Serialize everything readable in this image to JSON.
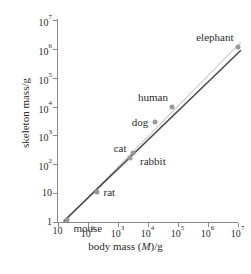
{
  "chart_data": {
    "type": "scatter",
    "title": "",
    "xlabel": "body mass (M)/g",
    "ylabel": "skeleton mass/g",
    "xscale": "log",
    "yscale": "log",
    "xlim": [
      10,
      10000000
    ],
    "ylim": [
      1,
      10000000
    ],
    "grid": false,
    "legend": null,
    "xticks": [
      {
        "value": 10,
        "label": "10",
        "exp": ""
      },
      {
        "value": 100,
        "label": "10",
        "exp": "2"
      },
      {
        "value": 1000,
        "label": "10",
        "exp": "3"
      },
      {
        "value": 10000,
        "label": "10",
        "exp": "4"
      },
      {
        "value": 100000,
        "label": "10",
        "exp": "5"
      },
      {
        "value": 1000000,
        "label": "10",
        "exp": "6"
      },
      {
        "value": 10000000,
        "label": "10",
        "exp": "7"
      }
    ],
    "yticks": [
      {
        "value": 1,
        "label": "1",
        "exp": ""
      },
      {
        "value": 10,
        "label": "10",
        "exp": ""
      },
      {
        "value": 100,
        "label": "10",
        "exp": "2"
      },
      {
        "value": 1000,
        "label": "10",
        "exp": "3"
      },
      {
        "value": 10000,
        "label": "10",
        "exp": "4"
      },
      {
        "value": 100000,
        "label": "10",
        "exp": "5"
      },
      {
        "value": 1000000,
        "label": "10",
        "exp": "6"
      },
      {
        "value": 10000000,
        "label": "10",
        "exp": "7"
      }
    ],
    "points": [
      {
        "name": "mouse",
        "x": 20,
        "y": 1.2,
        "label": "mouse",
        "label_pos": "right-below"
      },
      {
        "name": "rat",
        "x": 200,
        "y": 11,
        "label": "rat",
        "label_pos": "right"
      },
      {
        "name": "cat",
        "x": 2700,
        "y": 160,
        "label": "cat",
        "label_pos": "left-above"
      },
      {
        "name": "rabbit",
        "x": 3300,
        "y": 250,
        "label": "rabbit",
        "label_pos": "right-below"
      },
      {
        "name": "dog",
        "x": 18000,
        "y": 3000,
        "label": "dog",
        "label_pos": "left"
      },
      {
        "name": "human",
        "x": 65000,
        "y": 10000,
        "label": "human",
        "label_pos": "left-above"
      },
      {
        "name": "elephant",
        "x": 10000000,
        "y": 1200000,
        "label": "elephant",
        "label_pos": "left-above"
      }
    ],
    "series": [
      {
        "name": "fit-line",
        "type": "line",
        "color": "#b4b4b4",
        "description": "light grey best-fit line through data points",
        "x": [
          16,
          13000000
        ],
        "y": [
          1.0,
          1700000
        ]
      },
      {
        "name": "reference-line",
        "type": "line",
        "color": "#4a4a4a",
        "description": "dark reference line of slope 1 (isometric scaling)",
        "x": [
          16,
          13000000
        ],
        "y": [
          1.05,
          900000
        ]
      }
    ],
    "colors": {
      "marker": "#9a9a9a",
      "axis": "#8a8a8a",
      "text": "#2b2b2b",
      "fit_line": "#b4b4b4",
      "reference_line": "#4a4a4a",
      "background": "#ffffff"
    }
  }
}
